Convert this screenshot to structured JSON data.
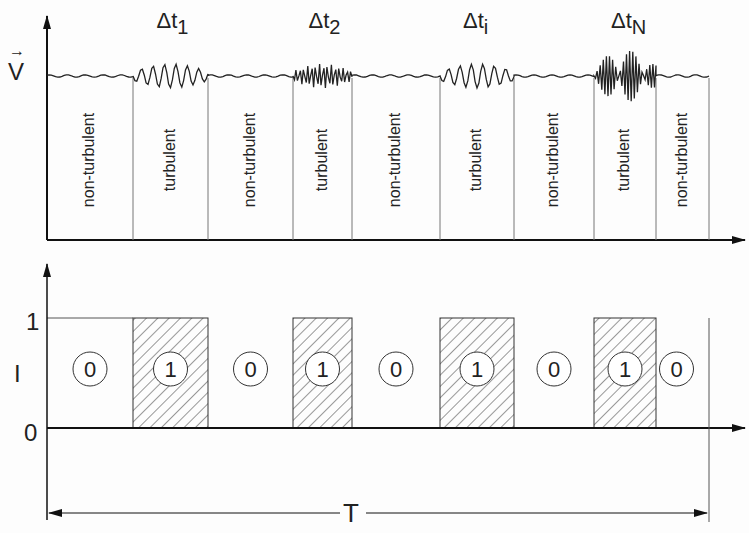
{
  "top_chart": {
    "y_axis_label": "V",
    "y_axis_vector_arrow": "→",
    "segments": [
      {
        "x0": 47,
        "x1": 133,
        "state": "non-turbulent",
        "label": "non-turbulent",
        "interval": ""
      },
      {
        "x0": 133,
        "x1": 208,
        "state": "turbulent",
        "label": "turbulent",
        "interval": "Δt",
        "sub": "1"
      },
      {
        "x0": 208,
        "x1": 293,
        "state": "non-turbulent",
        "label": "non-turbulent",
        "interval": ""
      },
      {
        "x0": 293,
        "x1": 352,
        "state": "turbulent",
        "label": "turbulent",
        "interval": "Δt",
        "sub": "2"
      },
      {
        "x0": 352,
        "x1": 440,
        "state": "non-turbulent",
        "label": "non-turbulent",
        "interval": ""
      },
      {
        "x0": 440,
        "x1": 514,
        "state": "turbulent",
        "label": "turbulent",
        "interval": "Δt",
        "sub": "i"
      },
      {
        "x0": 514,
        "x1": 594,
        "state": "non-turbulent",
        "label": "non-turbulent",
        "interval": ""
      },
      {
        "x0": 594,
        "x1": 656,
        "state": "turbulent",
        "label": "turbulent",
        "interval": "Δt",
        "sub": "N"
      },
      {
        "x0": 656,
        "x1": 709,
        "state": "non-turbulent",
        "label": "non-turbulent",
        "interval": ""
      }
    ]
  },
  "bottom_chart": {
    "y_axis_label": "I",
    "tick_one": "1",
    "tick_zero": "0",
    "indicator_values": [
      "0",
      "1",
      "0",
      "1",
      "0",
      "1",
      "0",
      "1",
      "0"
    ],
    "period_label": "T"
  }
}
